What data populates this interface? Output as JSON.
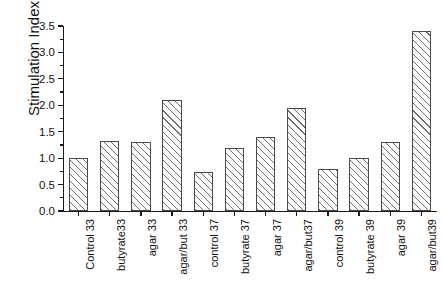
{
  "chart_data": {
    "type": "bar",
    "title": "GASTROINTESTINAL CELL LINES AS A MODEL FOR EXPERIMENTATION",
    "xlabel": "",
    "ylabel": "Stimulation Index",
    "ylim": [
      0.0,
      3.5
    ],
    "ytick_labels": [
      "0.0",
      "0.5",
      "1.0",
      "1.5",
      "2.0",
      "2.5",
      "3.0",
      "3.5"
    ],
    "ytick_values": [
      0.0,
      0.5,
      1.0,
      1.5,
      2.0,
      2.5,
      3.0,
      3.5
    ],
    "minor_ticks": true,
    "grid": false,
    "legend": "none",
    "categories": [
      "Control 33",
      "butyrate33",
      "agar 33",
      "agar/but 33",
      "control 37",
      "butyrate 37",
      "agar 37",
      "agar/but37",
      "control 39",
      "butyrate 39",
      "agar 39",
      "agar/but39"
    ],
    "values": [
      1.0,
      1.33,
      1.31,
      2.1,
      0.73,
      1.2,
      1.4,
      1.95,
      0.8,
      1.0,
      1.3,
      3.4
    ],
    "bar_style": {
      "fill": "diagonal-hatch",
      "hatch_color": "#6e6e6e",
      "edge_color": "#4a4a4a",
      "background": "#ffffff"
    }
  }
}
